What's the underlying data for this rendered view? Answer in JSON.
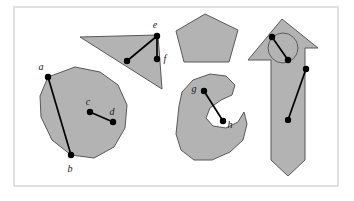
{
  "figure": {
    "background_color": "#ffffff",
    "frame": {
      "name": "figure-border",
      "x": 14,
      "y": 7,
      "width": 324,
      "height": 179,
      "stroke_color": "#d4d4d4"
    },
    "style": {
      "shape_fill": "#b3b3b3",
      "shape_stroke": "#58585a",
      "segment_color": "#000000",
      "label_color": "#1a1a1a"
    },
    "shapes": [
      {
        "name": "circle-blob",
        "kind": "convex-disk",
        "points": "48,77 40,96 41,117 52,140 71,155 94,158 114,147 125,128 127,105 118,85 100,72 75,67"
      },
      {
        "name": "triangle",
        "kind": "convex-triangle",
        "points": "80,37 158,35 162,89"
      },
      {
        "name": "pentagon",
        "kind": "convex-pentagon",
        "points": "205,14 238,30 229,62 184,62 176,31"
      },
      {
        "name": "kidney-blob",
        "kind": "non-convex-blob",
        "points": "179,106 182,92 193,80 210,74 226,76 235,85 232,95 221,100 210,108 206,118 213,126 226,128 238,122 244,112 247,124 243,140 230,152 212,160 194,160 181,150 176,134"
      },
      {
        "name": "arrow-house",
        "kind": "non-convex-arrow-with-hole",
        "points": "282,19 318,48 305,48 305,160 288,176 271,160 271,60 248,60"
      },
      {
        "name": "arrow-house-hole",
        "kind": "circular-hole",
        "cx": 283,
        "cy": 48,
        "r": 15
      }
    ],
    "segments": [
      {
        "name": "segment-ab",
        "from_label": "a",
        "to_label": "b",
        "x1": 48,
        "y1": 77,
        "x2": 71,
        "y2": 155
      },
      {
        "name": "segment-cd",
        "from_label": "c",
        "to_label": "d",
        "x1": 90,
        "y1": 112,
        "x2": 113,
        "y2": 122
      },
      {
        "name": "segment-e-interior",
        "from_label": "e",
        "to_label": "",
        "x1": 157,
        "y1": 36,
        "x2": 127,
        "y2": 61
      },
      {
        "name": "segment-ef",
        "from_label": "e",
        "to_label": "f",
        "x1": 157,
        "y1": 36,
        "x2": 157,
        "y2": 59
      },
      {
        "name": "segment-gh",
        "from_label": "g",
        "to_label": "h",
        "x1": 204,
        "y1": 91,
        "x2": 223,
        "y2": 121
      },
      {
        "name": "segment-arrow-upper",
        "from_label": "",
        "to_label": "",
        "x1": 272,
        "y1": 37,
        "x2": 288,
        "y2": 60
      },
      {
        "name": "segment-arrow-lower",
        "from_label": "",
        "to_label": "",
        "x1": 306,
        "y1": 69,
        "x2": 288,
        "y2": 120
      }
    ],
    "points": [
      {
        "name": "point-a",
        "label": "a",
        "x": 48,
        "y": 77,
        "label_x": 41,
        "label_y": 70
      },
      {
        "name": "point-b",
        "label": "b",
        "x": 71,
        "y": 155,
        "label_x": 70,
        "label_y": 172
      },
      {
        "name": "point-c",
        "label": "c",
        "x": 90,
        "y": 112,
        "label_x": 88,
        "label_y": 105
      },
      {
        "name": "point-d",
        "label": "d",
        "x": 113,
        "y": 122,
        "label_x": 112,
        "label_y": 115
      },
      {
        "name": "point-e",
        "label": "e",
        "x": 157,
        "y": 36,
        "label_x": 155,
        "label_y": 28
      },
      {
        "name": "point-e-interior",
        "label": "",
        "x": 127,
        "y": 61,
        "label_x": 0,
        "label_y": 0
      },
      {
        "name": "point-f",
        "label": "f",
        "x": 157,
        "y": 59,
        "label_x": 165,
        "label_y": 62
      },
      {
        "name": "point-g",
        "label": "g",
        "x": 204,
        "y": 91,
        "label_x": 194,
        "label_y": 92
      },
      {
        "name": "point-h",
        "label": "h",
        "x": 223,
        "y": 121,
        "label_x": 230,
        "label_y": 128
      },
      {
        "name": "point-arrow-1",
        "label": "",
        "x": 272,
        "y": 37,
        "label_x": 0,
        "label_y": 0
      },
      {
        "name": "point-arrow-2",
        "label": "",
        "x": 288,
        "y": 60,
        "label_x": 0,
        "label_y": 0
      },
      {
        "name": "point-arrow-3",
        "label": "",
        "x": 306,
        "y": 69,
        "label_x": 0,
        "label_y": 0
      },
      {
        "name": "point-arrow-4",
        "label": "",
        "x": 288,
        "y": 120,
        "label_x": 0,
        "label_y": 0
      }
    ]
  }
}
